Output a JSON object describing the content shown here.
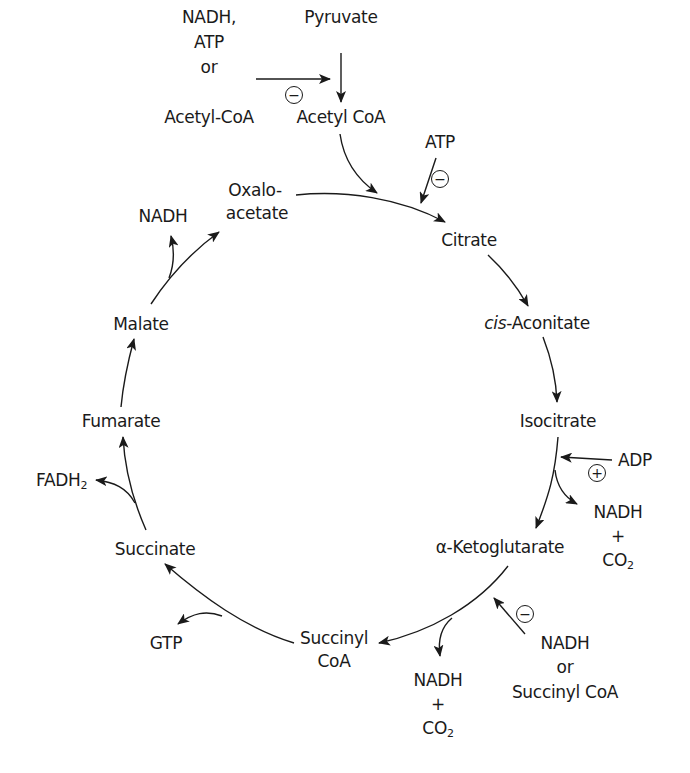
{
  "diagram": {
    "cycle_nodes": [
      {
        "id": "oxaloacetate",
        "line1": "Oxalo-",
        "line2": "acetate"
      },
      {
        "id": "citrate",
        "label": "Citrate"
      },
      {
        "id": "cis-aconitate",
        "prefix": "cis",
        "label": "-Aconitate"
      },
      {
        "id": "isocitrate",
        "label": "Isocitrate"
      },
      {
        "id": "alpha-ketoglutarate",
        "label": "α-Ketoglutarate"
      },
      {
        "id": "succinyl-coa",
        "line1": "Succinyl",
        "line2": "CoA"
      },
      {
        "id": "succinate",
        "label": "Succinate"
      },
      {
        "id": "fumarate",
        "label": "Fumarate"
      },
      {
        "id": "malate",
        "label": "Malate"
      }
    ],
    "entry": {
      "pyruvate": "Pyruvate",
      "acetyl_coa": "Acetyl CoA",
      "pdh_inhibitors": [
        "NADH,",
        "ATP",
        "or",
        "Acetyl-CoA"
      ],
      "pdh_effect": "−"
    },
    "regulators": {
      "citrate_synthase": {
        "effector": "ATP",
        "effect": "−"
      },
      "isocitrate_dh": {
        "effector": "ADP",
        "effect": "+"
      },
      "akg_dh": {
        "effectors": [
          "NADH",
          "or",
          "Succinyl CoA"
        ],
        "effect": "−"
      }
    },
    "products": {
      "isocitrate_step": {
        "line1": "NADH",
        "line2": "+",
        "line3": "CO",
        "sub": "2"
      },
      "akg_step": {
        "line1": "NADH",
        "line2": "+",
        "line3": "CO",
        "sub": "2"
      },
      "succinyl_coa_step": "GTP",
      "succinate_step": {
        "main": "FADH",
        "sub": "2"
      },
      "malate_step": "NADH"
    },
    "colors": {
      "ink": "#1a1a1a",
      "background": "#ffffff"
    }
  }
}
